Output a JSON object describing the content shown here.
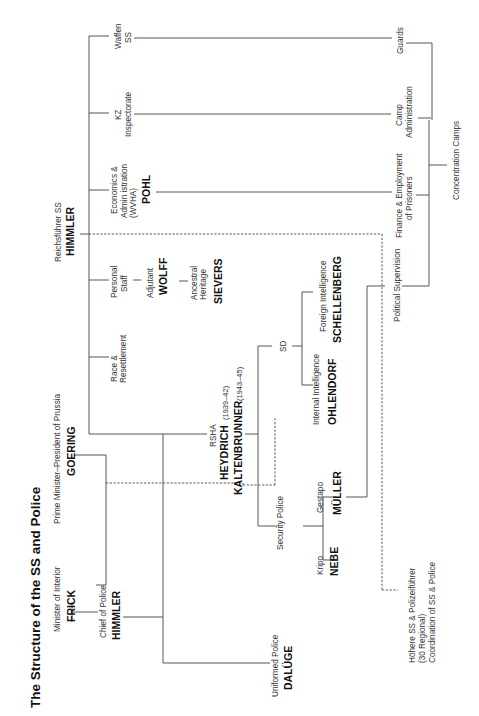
{
  "diagram": {
    "title": "The Structure of the SS and Police",
    "orientation": "rotated 90° counter-clockwise",
    "nodes": {
      "frick": {
        "role": "Minister of Interior",
        "name": "FRICK"
      },
      "goering": {
        "role": "Prime Minister–President of Prussia",
        "name": "GOERING"
      },
      "himmler_police": {
        "role": "Chief of Police",
        "name": "HIMMLER"
      },
      "dalurge": {
        "role": "Uniformed Police",
        "name": "DALÜGE"
      },
      "himmler_ss": {
        "role": "Reichsführer SS",
        "name": "HIMMLER"
      },
      "race": {
        "role_line1": "Race &",
        "role_line2": "Resettlement"
      },
      "personal_staff": {
        "role_line1": "Personal",
        "role_line2": "Staff"
      },
      "wolff": {
        "role": "Adjutant",
        "name": "WOLFF"
      },
      "sievers": {
        "role_line1": "Ancestral",
        "role_line2": "Heritage",
        "name": "SIEVERS"
      },
      "wvha": {
        "role_line1": "Economics &",
        "role_line2": "Admin istration",
        "role_line3": "(WVHA)",
        "name": "POHL"
      },
      "kz": {
        "role_line1": "KZ",
        "role_line2": "Inspectorate"
      },
      "waffen": {
        "role_line1": "Waffen",
        "role_line2": "SS"
      },
      "rsha": {
        "role": "RSHA",
        "name1": "HEYDRICH",
        "years1": "(1939–42)",
        "name2": "KALTENBRUNNER",
        "years2": "(1943–45)"
      },
      "security_police": {
        "role": "Security Police"
      },
      "kripo": {
        "role": "Kripo",
        "name": "NEBE"
      },
      "gestapo": {
        "role": "Gestapo",
        "name": "MÜLLER"
      },
      "sd": {
        "role": "SD"
      },
      "internal": {
        "role": "Internal Intelligence",
        "name": "OHLENDORF"
      },
      "foreign": {
        "role": "Foreign Intelligence",
        "name": "SCHELLENBERG"
      },
      "hssp": {
        "line1": "Höhere SS & Polizeiführer",
        "line2": "(30 Regional)",
        "line3": "Coordination of SS & Police"
      },
      "political": {
        "role": "Political Supervision"
      },
      "finance": {
        "role_line1": "Finance & Employment",
        "role_line2": "of Prisoners"
      },
      "camp_admin": {
        "role_line1": "Camp",
        "role_line2": "Administration"
      },
      "guards": {
        "role": "Guards"
      },
      "camps": {
        "role": "Concentration  Camps"
      }
    }
  }
}
